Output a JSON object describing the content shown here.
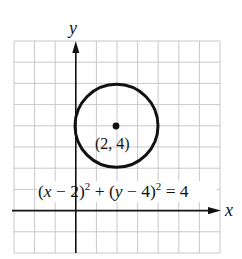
{
  "figure": {
    "type": "circle-on-coordinate-grid",
    "axes": {
      "x_label": "x",
      "y_label": "y",
      "x_range": [
        -3,
        7
      ],
      "y_range": [
        -2,
        8
      ],
      "grid": true,
      "grid_step": 1
    },
    "circle": {
      "center": {
        "x": 2,
        "y": 4
      },
      "radius": 2,
      "center_label": "(2, 4)"
    },
    "equation": {
      "part1": "(",
      "x_var": "x",
      "part2": " − 2)",
      "exp1": "2",
      "part3": " + (",
      "y_var": "y",
      "part4": " − 4)",
      "exp2": "2",
      "part5": " = 4"
    },
    "colors": {
      "grid": "#c8c8c8",
      "axis": "#111111",
      "circle": "#111111",
      "background": "#ffffff"
    }
  }
}
